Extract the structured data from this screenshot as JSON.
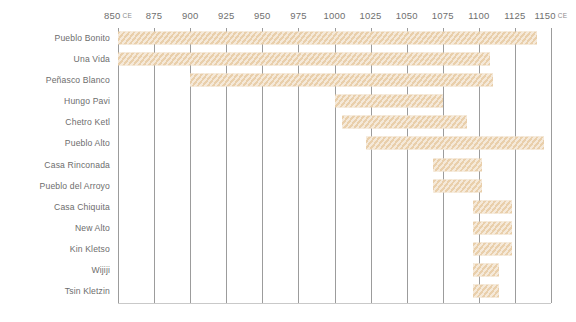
{
  "chart_data": {
    "type": "bar",
    "orientation": "horizontal",
    "title": "",
    "xlabel": "",
    "ylabel": "",
    "xlim": [
      850,
      1150
    ],
    "x_tick_step": 25,
    "x_ticks": [
      850,
      875,
      900,
      925,
      950,
      975,
      1000,
      1025,
      1050,
      1075,
      1100,
      1125,
      1150
    ],
    "x_tick_labels": [
      "850",
      "875",
      "900",
      "925",
      "950",
      "975",
      "1000",
      "1025",
      "1050",
      "1075",
      "1100",
      "1125",
      "1150"
    ],
    "era_suffix": "CE",
    "era_on_first_tick": true,
    "era_on_last_tick": true,
    "grid": true,
    "grid_axis": "x",
    "legend": "none",
    "bar_color": "#e9cfab",
    "bar_pattern": "diagonal-hatch",
    "gridline_color": "#9c9c9c",
    "baseline_color": "#c9c9c9",
    "categories": [
      "Pueblo Bonito",
      "Una Vida",
      "Peñasco Blanco",
      "Hungo Pavi",
      "Chetro Ketl",
      "Pueblo Alto",
      "Casa Rinconada",
      "Pueblo del Arroyo",
      "Casa Chiquita",
      "New Alto",
      "Kin Kletso",
      "Wijiji",
      "Tsin Kletzin"
    ],
    "ranges": [
      {
        "label": "Pueblo Bonito",
        "start": 850,
        "end": 1140
      },
      {
        "label": "Una Vida",
        "start": 850,
        "end": 1108
      },
      {
        "label": "Peñasco Blanco",
        "start": 900,
        "end": 1110
      },
      {
        "label": "Hungo Pavi",
        "start": 1000,
        "end": 1075
      },
      {
        "label": "Chetro Ketl",
        "start": 1005,
        "end": 1092
      },
      {
        "label": "Pueblo Alto",
        "start": 1022,
        "end": 1145
      },
      {
        "label": "Casa Rinconada",
        "start": 1068,
        "end": 1102
      },
      {
        "label": "Pueblo del Arroyo",
        "start": 1068,
        "end": 1102
      },
      {
        "label": "Casa Chiquita",
        "start": 1096,
        "end": 1123
      },
      {
        "label": "New Alto",
        "start": 1096,
        "end": 1123
      },
      {
        "label": "Kin Kletso",
        "start": 1096,
        "end": 1123
      },
      {
        "label": "Wijiji",
        "start": 1096,
        "end": 1114
      },
      {
        "label": "Tsin Kletzin",
        "start": 1096,
        "end": 1114
      }
    ]
  }
}
